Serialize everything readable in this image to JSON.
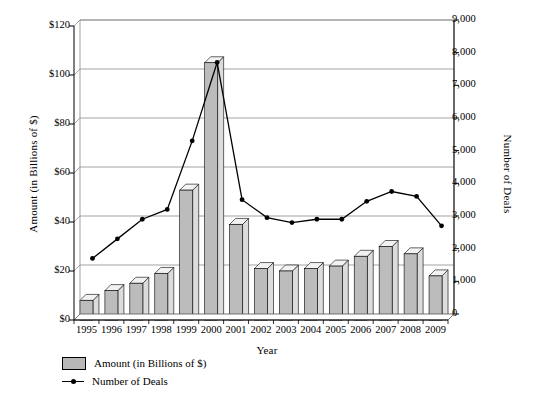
{
  "chart_data": {
    "type": "bar",
    "title": "",
    "xlabel": "Year",
    "ylabel": "Amount (in Billions of $)",
    "y2label": "Number of Deals",
    "categories": [
      "1995",
      "1996",
      "1997",
      "1998",
      "1999",
      "2000",
      "2001",
      "2002",
      "2003",
      "2004",
      "2005",
      "2006",
      "2007",
      "2008",
      "2009"
    ],
    "ylim": [
      0,
      120
    ],
    "y2lim": [
      0,
      9000
    ],
    "yticks": [
      "$0",
      "$20",
      "$40",
      "$60",
      "$80",
      "$100",
      "$120"
    ],
    "ytick_values": [
      0,
      20,
      40,
      60,
      80,
      100,
      120
    ],
    "y2ticks": [
      "0",
      "1,000",
      "2,000",
      "3,000",
      "4,000",
      "5,000",
      "6,000",
      "7,000",
      "8,000",
      "9,000"
    ],
    "y2tick_values": [
      0,
      1000,
      2000,
      3000,
      4000,
      5000,
      6000,
      7000,
      8000,
      9000
    ],
    "grid": true,
    "legend_position": "bottom-left",
    "series": [
      {
        "name": "Amount (in Billions of $)",
        "type": "bar",
        "axis": "left",
        "color": "#bcbcbc",
        "values": [
          8,
          12,
          15,
          19,
          53,
          105,
          39,
          21,
          20,
          21,
          22,
          26,
          30,
          27,
          18
        ]
      },
      {
        "name": "Number of Deals",
        "type": "line",
        "axis": "right",
        "color": "#000000",
        "values": [
          1700,
          2300,
          2900,
          3200,
          5300,
          7700,
          3500,
          2950,
          2800,
          2900,
          2900,
          3450,
          3750,
          3600,
          2700
        ]
      }
    ]
  },
  "legend": {
    "items": [
      {
        "label": "Amount (in Billions of $)",
        "marker": "bar-swatch-icon"
      },
      {
        "label": "Number of Deals",
        "marker": "line-marker-icon"
      }
    ]
  }
}
